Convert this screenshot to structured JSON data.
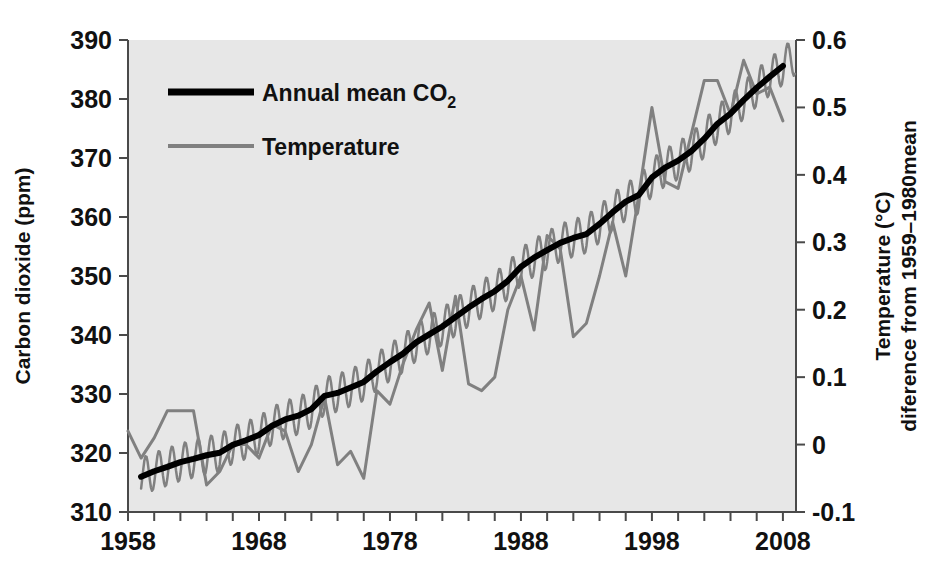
{
  "chart_data": {
    "type": "line",
    "title": "",
    "xlabel": "",
    "ylabel": "Carbon dioxide (ppm)",
    "y2label_line1": "Temperature (°C)",
    "y2label_line2": "diference from 1959–1980mean",
    "xlim": [
      1958,
      2009
    ],
    "ylim": [
      310,
      390
    ],
    "y2lim": [
      -0.1,
      0.6
    ],
    "grid": false,
    "legend_position": "upper-left-inside",
    "x_ticks": [
      "1958",
      "1968",
      "1978",
      "1988",
      "1998",
      "2008"
    ],
    "x_tick_values": [
      1958,
      1968,
      1978,
      1988,
      1998,
      2008
    ],
    "x_minor_tick_step": 2,
    "y_ticks": [
      "310",
      "320",
      "330",
      "340",
      "350",
      "360",
      "370",
      "380",
      "390"
    ],
    "y_tick_values": [
      310,
      320,
      330,
      340,
      350,
      360,
      370,
      380,
      390
    ],
    "y2_ticks": [
      "-0.1",
      "0",
      "0.1",
      "0.2",
      "0.3",
      "0.4",
      "0.5",
      "0.6"
    ],
    "y2_tick_values": [
      -0.1,
      0,
      0.1,
      0.2,
      0.3,
      0.4,
      0.5,
      0.6
    ],
    "plot_bgcolor": "#e7e7e7",
    "page_bgcolor": "#ffffff",
    "series": [
      {
        "name": "Annual mean CO2",
        "legend_text": "Annual mean CO",
        "legend_subscript": "2",
        "color": "#000000",
        "width": 6,
        "axis": "left",
        "units": "ppm",
        "x": [
          1959,
          1960,
          1961,
          1962,
          1963,
          1964,
          1965,
          1966,
          1967,
          1968,
          1969,
          1970,
          1971,
          1972,
          1973,
          1974,
          1975,
          1976,
          1977,
          1978,
          1979,
          1980,
          1981,
          1982,
          1983,
          1984,
          1985,
          1986,
          1987,
          1988,
          1989,
          1990,
          1991,
          1992,
          1993,
          1994,
          1995,
          1996,
          1997,
          1998,
          1999,
          2000,
          2001,
          2002,
          2003,
          2004,
          2005,
          2006,
          2007,
          2008
        ],
        "values": [
          315.98,
          316.91,
          317.64,
          318.45,
          318.99,
          319.62,
          320.04,
          321.38,
          322.16,
          323.04,
          324.62,
          325.68,
          326.32,
          327.45,
          329.68,
          330.18,
          331.11,
          332.04,
          333.83,
          335.4,
          336.84,
          338.75,
          340.11,
          341.45,
          343.05,
          344.65,
          346.12,
          347.42,
          349.19,
          351.57,
          353.12,
          354.39,
          355.61,
          356.45,
          357.1,
          358.83,
          360.82,
          362.61,
          363.73,
          366.7,
          368.38,
          369.55,
          371.14,
          373.28,
          375.8,
          377.52,
          379.8,
          381.9,
          383.79,
          385.6
        ]
      },
      {
        "name": "Monthly CO2",
        "color": "#808080",
        "width": 2.5,
        "axis": "left",
        "units": "ppm",
        "seasonal_amplitude_ppm": 3.2,
        "description": "monthly Mauna Loa CO2 sawtooth oscillating about the annual mean"
      },
      {
        "name": "Temperature",
        "legend_text": "Temperature",
        "color": "#808080",
        "width": 3,
        "axis": "right",
        "units": "°C",
        "x": [
          1958,
          1959,
          1960,
          1961,
          1962,
          1963,
          1964,
          1965,
          1966,
          1967,
          1968,
          1969,
          1970,
          1971,
          1972,
          1973,
          1974,
          1975,
          1976,
          1977,
          1978,
          1979,
          1980,
          1981,
          1982,
          1983,
          1984,
          1985,
          1986,
          1987,
          1988,
          1989,
          1990,
          1991,
          1992,
          1993,
          1994,
          1995,
          1996,
          1997,
          1998,
          1999,
          2000,
          2001,
          2002,
          2003,
          2004,
          2005,
          2006,
          2007,
          2008
        ],
        "values": [
          0.02,
          -0.02,
          0.01,
          0.05,
          0.05,
          0.05,
          -0.06,
          -0.04,
          0.0,
          0.0,
          -0.02,
          0.03,
          0.02,
          -0.04,
          0.0,
          0.07,
          -0.03,
          -0.01,
          -0.05,
          0.08,
          0.06,
          0.12,
          0.17,
          0.21,
          0.11,
          0.22,
          0.09,
          0.08,
          0.1,
          0.2,
          0.25,
          0.17,
          0.31,
          0.29,
          0.16,
          0.18,
          0.25,
          0.33,
          0.25,
          0.37,
          0.5,
          0.39,
          0.38,
          0.46,
          0.54,
          0.54,
          0.49,
          0.57,
          0.52,
          0.53,
          0.48
        ]
      }
    ]
  },
  "axes": {
    "left_title": "Carbon dioxide (ppm)",
    "right_title_line1": "Temperature (°C)",
    "right_title_line2": "diference from 1959–1980mean"
  },
  "legend": {
    "items": [
      {
        "label": "Annual mean CO",
        "subscript": "2",
        "color": "#000000",
        "thick": true
      },
      {
        "label": "Temperature",
        "subscript": "",
        "color": "#808080",
        "thick": false
      }
    ]
  }
}
